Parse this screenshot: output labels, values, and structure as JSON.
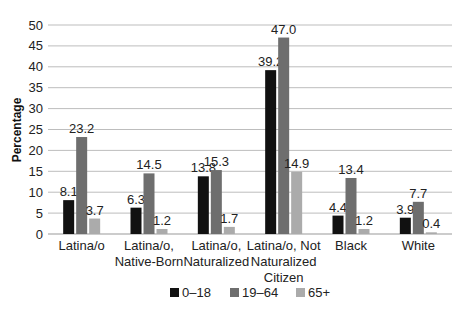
{
  "chart_data": {
    "type": "bar",
    "title": "",
    "xlabel": "",
    "ylabel": "Percentage",
    "ylim": [
      0,
      50
    ],
    "yticks": [
      0,
      5,
      10,
      15,
      20,
      25,
      30,
      35,
      40,
      45,
      50
    ],
    "grid": true,
    "legend_position": "bottom",
    "categories": [
      [
        "Latina/o"
      ],
      [
        "Latina/o,",
        "Native-Born"
      ],
      [
        "Latina/o,",
        "Naturalized"
      ],
      [
        "Latina/o, Not",
        "Naturalized",
        "Citizen"
      ],
      [
        "Black"
      ],
      [
        "White"
      ]
    ],
    "series": [
      {
        "name": "0–18",
        "color": "#111111",
        "values": [
          8.1,
          6.3,
          13.8,
          39.2,
          4.4,
          3.9
        ]
      },
      {
        "name": "19–64",
        "color": "#6e6e6e",
        "values": [
          23.2,
          14.5,
          15.3,
          47.0,
          13.4,
          7.7
        ]
      },
      {
        "name": "65+",
        "color": "#ababab",
        "values": [
          3.7,
          1.2,
          1.7,
          14.9,
          1.2,
          0.4
        ]
      }
    ]
  }
}
